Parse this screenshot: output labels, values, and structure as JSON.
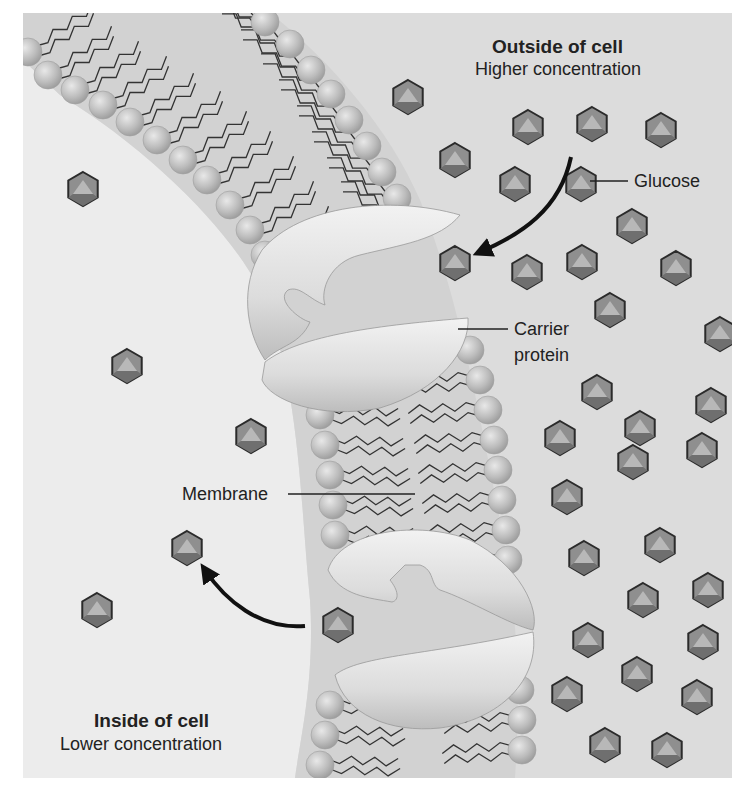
{
  "diagram": {
    "topic": "Facilitated diffusion of glucose through a carrier protein",
    "regions": {
      "outside": {
        "title": "Outside of cell",
        "subtitle": "Higher concentration"
      },
      "inside": {
        "title": "Inside of cell",
        "subtitle": "Lower concentration"
      }
    },
    "labels": {
      "glucose": "Glucose",
      "carrier_protein_line1": "Carrier",
      "carrier_protein_line2": "protein",
      "membrane": "Membrane"
    },
    "colors": {
      "border": "#ffffff",
      "outside_bg": "#dcdcdc",
      "inside_bg": "#ececec",
      "membrane_core": "#d3d3d3",
      "phospholipid_head": "#b9b9b9",
      "protein": "#e4e4e4",
      "glucose_fill": "#8f8f8f",
      "glucose_stroke": "#2b2b2b",
      "arrow": "#111111"
    },
    "glucose_outside": [
      [
        408,
        97
      ],
      [
        528,
        127
      ],
      [
        592,
        124
      ],
      [
        661,
        130
      ],
      [
        455,
        160
      ],
      [
        515,
        184
      ],
      [
        581,
        184
      ],
      [
        632,
        226
      ],
      [
        455,
        263
      ],
      [
        527,
        272
      ],
      [
        582,
        262
      ],
      [
        676,
        268
      ],
      [
        610,
        310
      ],
      [
        720,
        334
      ],
      [
        597,
        392
      ],
      [
        711,
        405
      ],
      [
        640,
        428
      ],
      [
        560,
        438
      ],
      [
        633,
        462
      ],
      [
        702,
        450
      ],
      [
        567,
        497
      ],
      [
        584,
        558
      ],
      [
        660,
        545
      ],
      [
        708,
        590
      ],
      [
        643,
        600
      ],
      [
        588,
        640
      ],
      [
        703,
        642
      ],
      [
        637,
        674
      ],
      [
        567,
        694
      ],
      [
        697,
        697
      ],
      [
        605,
        745
      ],
      [
        667,
        750
      ]
    ],
    "glucose_inside": [
      [
        83,
        189
      ],
      [
        127,
        366
      ],
      [
        251,
        436
      ],
      [
        187,
        548
      ],
      [
        97,
        610
      ],
      [
        338,
        625
      ]
    ]
  }
}
